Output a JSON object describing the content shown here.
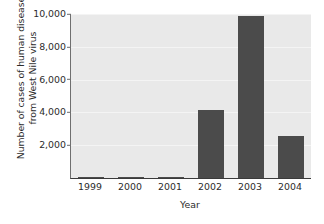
{
  "chart_data": {
    "type": "bar",
    "title": "",
    "xlabel": "Year",
    "ylabel": "Number of cases of human disease from West Nile virus",
    "ylabel_lines": [
      "Number of cases of human disease",
      "from West Nile virus"
    ],
    "categories": [
      "1999",
      "2000",
      "2001",
      "2002",
      "2003",
      "2004"
    ],
    "values": [
      62,
      21,
      66,
      4156,
      9862,
      2539
    ],
    "ylim": [
      0,
      10000
    ],
    "ytick_labels": [
      "10,000",
      "8,000",
      "6,000",
      "4,000",
      "2,000"
    ],
    "ytick_values": [
      10000,
      8000,
      6000,
      4000,
      2000
    ],
    "grid": true,
    "legend": "none",
    "colors": {
      "bar": "#4b4b4b",
      "plot_background": "#e9e9e9",
      "gridline": "#f4f4f4",
      "axis": "#3a3a3a",
      "text": "#2b2b2b",
      "page_background": "#ffffff"
    }
  }
}
